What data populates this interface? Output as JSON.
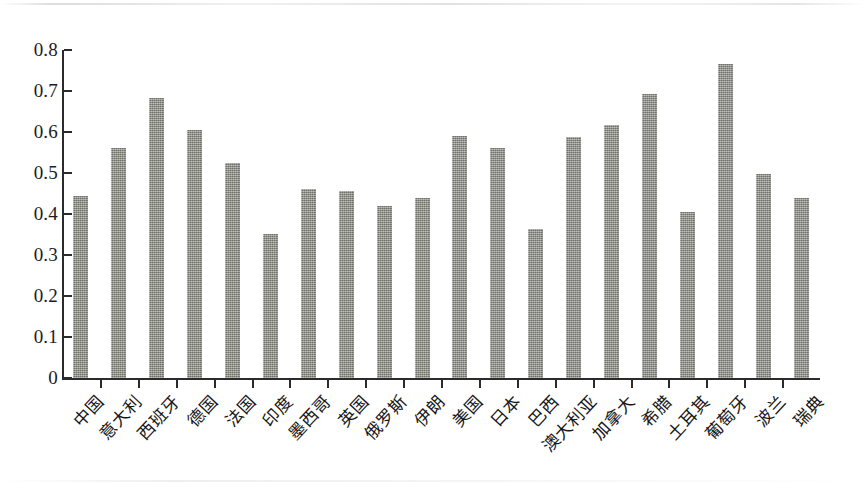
{
  "chart_data": {
    "type": "bar",
    "title": "",
    "subtitle": "",
    "xlabel": "",
    "ylabel": "",
    "ylim": [
      0,
      0.8
    ],
    "ytick_labels": [
      "0.8",
      "0.7",
      "0.6",
      "0.5",
      "0.4",
      "0.3",
      "0.2",
      "0.1",
      "0"
    ],
    "ytick_values": [
      0.8,
      0.7,
      0.6,
      0.5,
      0.4,
      0.3,
      0.2,
      0.1,
      0
    ],
    "grid": false,
    "legend": null,
    "bar_color": "#86867f",
    "axis_color": "#2b2b2b",
    "categories": [
      "中国",
      "意大利",
      "西班牙",
      "德国",
      "法国",
      "印度",
      "墨西哥",
      "英国",
      "俄罗斯",
      "伊朗",
      "美国",
      "日本",
      "巴西",
      "澳大利亚",
      "加拿大",
      "希腊",
      "土耳其",
      "葡萄牙",
      "波兰",
      "瑞典"
    ],
    "values": [
      0.445,
      0.562,
      0.682,
      0.606,
      0.525,
      0.351,
      0.462,
      0.455,
      0.42,
      0.44,
      0.59,
      0.561,
      0.363,
      0.588,
      0.618,
      0.693,
      0.405,
      0.765,
      0.498,
      0.439
    ]
  }
}
